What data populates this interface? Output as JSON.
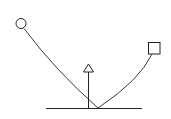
{
  "diagram": {
    "stroke_color": "#222222",
    "background": "#ffffff",
    "baseline": {
      "x1": 46,
      "y1": 108.5,
      "x2": 142,
      "y2": 108.5
    },
    "meeting_point": {
      "x": 98,
      "y": 108
    },
    "circle": {
      "cx": 21,
      "cy": 23.5,
      "r": 5
    },
    "square": {
      "x": 148.5,
      "y": 42.5,
      "size": 11.5
    },
    "triangle": {
      "apex_x": 88.5,
      "apex_y": 64,
      "base_left_x": 83.5,
      "base_right_x": 93.5,
      "base_y": 72
    },
    "arrow_stem": {
      "x": 88.5,
      "y1": 72,
      "y2": 108.5
    },
    "curve_left": "M 24 28.5 Q 55 70 98 108",
    "curve_right": "M 152 54 Q 140 80 98 108"
  }
}
